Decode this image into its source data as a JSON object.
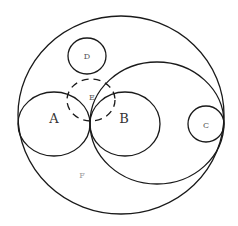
{
  "diagram": {
    "type": "nested-circles-region-diagram",
    "colors": {
      "stroke": "#1a1a1a",
      "background": "#ffffff",
      "label": "#333333"
    },
    "shapes": [
      {
        "id": "outer",
        "kind": "ellipse",
        "cx": 121,
        "cy": 115,
        "rx": 103,
        "ry": 99,
        "dashed": false
      },
      {
        "id": "large",
        "kind": "ellipse",
        "cx": 157,
        "cy": 123,
        "rx": 67,
        "ry": 61,
        "dashed": false
      },
      {
        "id": "A",
        "kind": "ellipse",
        "cx": 54,
        "cy": 124,
        "rx": 36,
        "ry": 32,
        "dashed": false
      },
      {
        "id": "B",
        "kind": "ellipse",
        "cx": 125,
        "cy": 124,
        "rx": 35,
        "ry": 32,
        "dashed": false
      },
      {
        "id": "C",
        "kind": "ellipse",
        "cx": 206,
        "cy": 124,
        "rx": 18,
        "ry": 18,
        "dashed": false
      },
      {
        "id": "D",
        "kind": "ellipse",
        "cx": 87,
        "cy": 56,
        "rx": 19,
        "ry": 18,
        "dashed": false
      },
      {
        "id": "E",
        "kind": "ellipse",
        "cx": 91,
        "cy": 100,
        "rx": 24,
        "ry": 21,
        "dashed": true
      }
    ],
    "labels": {
      "A": {
        "text": "A",
        "x": 54,
        "y": 119
      },
      "B": {
        "text": "B",
        "x": 124,
        "y": 119
      },
      "C": {
        "text": "C",
        "x": 206,
        "y": 126
      },
      "D": {
        "text": "D",
        "x": 87,
        "y": 57
      },
      "E": {
        "text": "E",
        "x": 92,
        "y": 98
      },
      "F": {
        "text": "F",
        "x": 82,
        "y": 176
      }
    }
  }
}
